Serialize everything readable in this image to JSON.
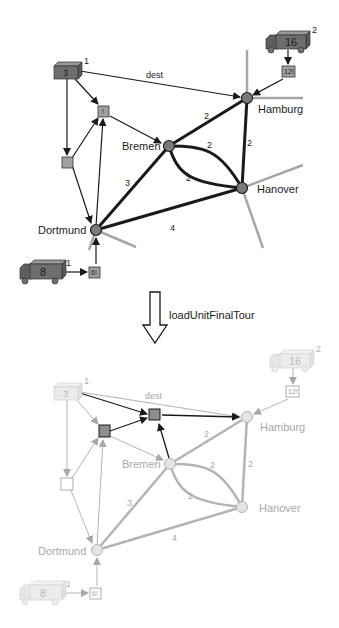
{
  "transformation": {
    "rule_name": "loadUnitFinalTour"
  },
  "colors": {
    "active_stroke": "#1a1a1a",
    "node_fill": "#7a7a7a",
    "box_fill": "#a0a0a0",
    "truck_fill": "#6e6e6e",
    "faded_stroke": "#b0b0b0",
    "faded_text": "#a8a8a8",
    "faded_node_fill": "#e4e4e4",
    "faded_truck_fill": "#ececec",
    "grey_road": "#a6a6a6"
  },
  "before": {
    "cities": [
      {
        "name": "Hamburg"
      },
      {
        "name": "Bremen"
      },
      {
        "name": "Hanover"
      },
      {
        "name": "Dortmund"
      }
    ],
    "edges": [
      {
        "from": "Bremen",
        "to": "Hamburg",
        "weight": "2"
      },
      {
        "from": "Hamburg",
        "to": "Hanover",
        "weight": "2"
      },
      {
        "from": "Bremen",
        "to": "Hanover",
        "weight": "2",
        "variant": "upper"
      },
      {
        "from": "Bremen",
        "to": "Hanover",
        "weight": "2",
        "variant": "lower"
      },
      {
        "from": "Dortmund",
        "to": "Bremen",
        "weight": "3"
      },
      {
        "from": "Dortmund",
        "to": "Hanover",
        "weight": "4"
      }
    ],
    "container": {
      "label": "3",
      "superscript": "1",
      "dest_label": "dest"
    },
    "trucks": [
      {
        "capacity": "16",
        "superscript": "2",
        "location_box": "12!"
      },
      {
        "capacity": "8",
        "superscript": "1",
        "location_box": "6!"
      }
    ],
    "tour_box": {
      "label": "!"
    }
  },
  "after": {
    "cities": [
      {
        "name": "Hamburg"
      },
      {
        "name": "Bremen"
      },
      {
        "name": "Hanover"
      },
      {
        "name": "Dortmund"
      }
    ],
    "edges": [
      {
        "weight": "2"
      },
      {
        "weight": "2"
      },
      {
        "weight": "2"
      },
      {
        "weight": "2"
      },
      {
        "weight": "3"
      },
      {
        "weight": "4"
      }
    ],
    "container": {
      "label": "3",
      "superscript": "1",
      "dest_label": "dest"
    },
    "trucks": [
      {
        "capacity": "16",
        "superscript": "2",
        "location_box": "12!"
      },
      {
        "capacity": "8",
        "superscript": "1",
        "location_box": "6!"
      }
    ]
  }
}
